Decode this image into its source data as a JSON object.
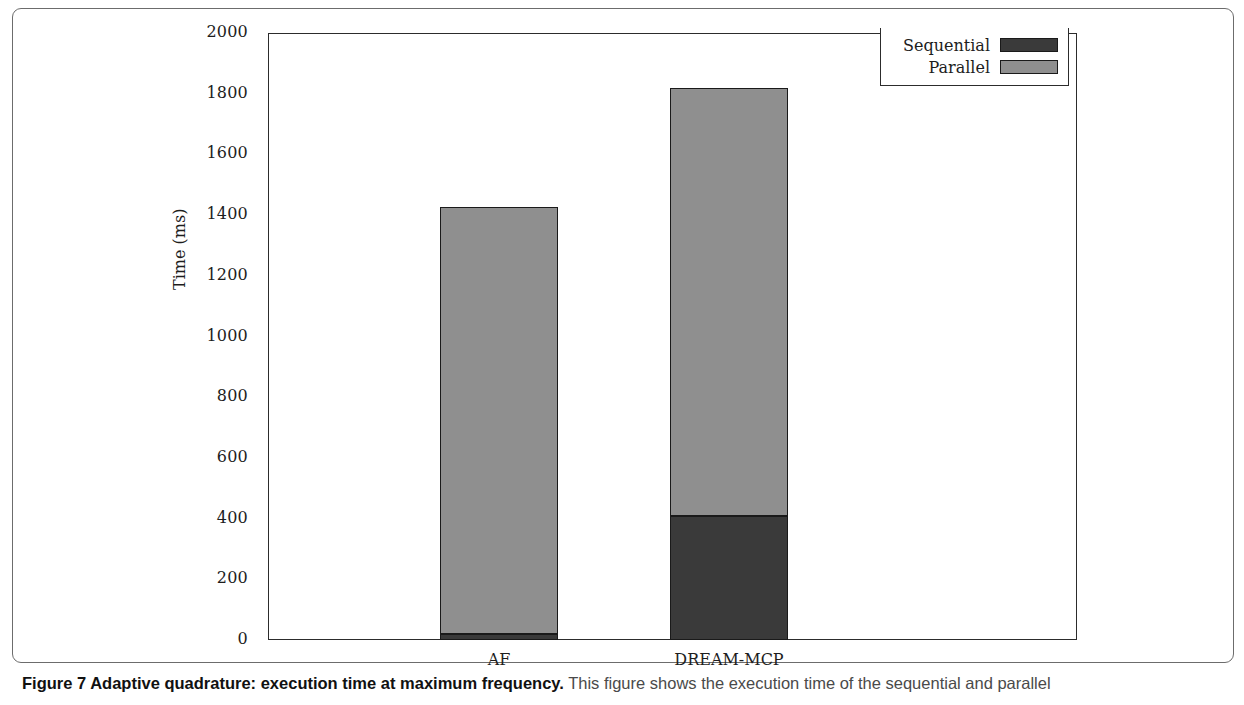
{
  "figure": {
    "caption_bold": "Figure 7 Adaptive quadrature: execution time at maximum frequency.",
    "caption_rest": " This figure shows the execution time of the sequential and parallel"
  },
  "chart_data": {
    "type": "bar",
    "subtype": "stacked-bar",
    "title": "",
    "xlabel": "",
    "ylabel": "Time (ms)",
    "categories": [
      "AF",
      "DREAM-MCP"
    ],
    "series": [
      {
        "name": "Sequential",
        "values": [
          20,
          408
        ],
        "color": "#3a3a3a"
      },
      {
        "name": "Parallel",
        "values": [
          1408,
          1412
        ],
        "color": "#8f8f8f"
      }
    ],
    "totals": [
      1428,
      1820
    ],
    "ylim": [
      0,
      2000
    ],
    "yticks": [
      0,
      200,
      400,
      600,
      800,
      1000,
      1200,
      1400,
      1600,
      1800,
      2000
    ],
    "ytick_labels": [
      "0",
      "200",
      "400",
      "600",
      "800",
      "1000",
      "1200",
      "1400",
      "1600",
      "1800",
      "2000"
    ],
    "grid": false,
    "legend_position": "top-right",
    "legend_entries": [
      "Sequential",
      "Parallel"
    ]
  },
  "colors": {
    "sequential": "#3a3a3a",
    "parallel": "#8f8f8f",
    "axis": "#2c2c2c",
    "bar_outline": "#1a1a1a",
    "frame": "#6c6c6c"
  }
}
